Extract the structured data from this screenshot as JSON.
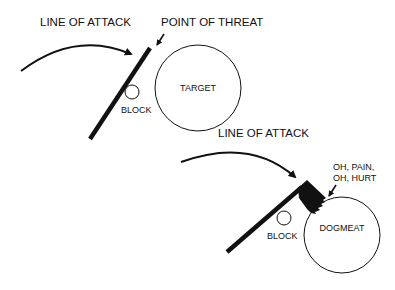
{
  "diagrams": [
    {
      "id": "before",
      "line_of_attack_label": "LINE OF ATTACK",
      "point_of_threat_label": "POINT OF THREAT",
      "block_label": "BLOCK",
      "target_label": "TARGET"
    },
    {
      "id": "after",
      "line_of_attack_label": "LINE OF ATTACK",
      "pain_label_line1": "OH, PAIN,",
      "pain_label_line2": "OH, HURT",
      "block_label": "BLOCK",
      "target_label": "DOGMEAT"
    }
  ],
  "colors": {
    "ink": "#111111",
    "background": "#ffffff"
  }
}
